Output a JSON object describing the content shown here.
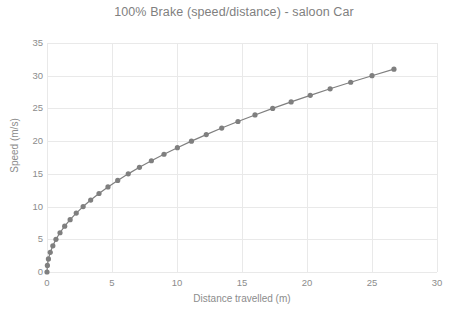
{
  "chart_data": {
    "type": "line",
    "title": "100% Brake (speed/distance) - saloon Car",
    "xlabel": "Distance travelled (m)",
    "ylabel": "Speed (m/s)",
    "xlim": [
      0,
      30
    ],
    "ylim": [
      0,
      35
    ],
    "xticks": [
      0,
      5,
      10,
      15,
      20,
      25,
      30
    ],
    "yticks": [
      0,
      5,
      10,
      15,
      20,
      25,
      30,
      35
    ],
    "grid": true,
    "legend": false,
    "marker": "circle",
    "marker_color": "#7f7f7f",
    "line_color": "#7f7f7f",
    "series": [
      {
        "name": "100% Brake saloon Car",
        "x": [
          0,
          0.03,
          0.11,
          0.25,
          0.45,
          0.69,
          1.0,
          1.36,
          1.78,
          2.25,
          2.78,
          3.36,
          4.0,
          4.69,
          5.44,
          6.25,
          7.11,
          8.03,
          9.0,
          10.03,
          11.11,
          12.25,
          13.44,
          14.69,
          16.0,
          17.36,
          18.78,
          20.25,
          21.78,
          23.36,
          25.0,
          26.69
        ],
        "y": [
          0,
          1,
          2,
          3,
          4,
          5,
          6,
          7,
          8,
          9,
          10,
          11,
          12,
          13,
          14,
          15,
          16,
          17,
          18,
          19,
          20,
          21,
          22,
          23,
          24,
          25,
          26,
          27,
          28,
          29,
          30,
          31
        ]
      }
    ]
  },
  "colors": {
    "series": "#7f7f7f",
    "grid": "#e9e9e9",
    "axis": "#d9d9d9",
    "text": "#8c8c8c",
    "title_text": "#7f7f7f",
    "background": "#ffffff"
  }
}
